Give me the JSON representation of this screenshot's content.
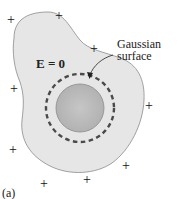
{
  "diagram": {
    "panel_label": "(a)",
    "field_label": "E = 0",
    "callout": {
      "line1": "Gaussian",
      "line2": "surface"
    },
    "charge_symbol": "+",
    "charges": [
      {
        "x": 12,
        "y": 20
      },
      {
        "x": 60,
        "y": 16
      },
      {
        "x": 95,
        "y": 49
      },
      {
        "x": 15,
        "y": 89
      },
      {
        "x": 150,
        "y": 106
      },
      {
        "x": 14,
        "y": 150
      },
      {
        "x": 127,
        "y": 166
      },
      {
        "x": 88,
        "y": 180
      },
      {
        "x": 45,
        "y": 184
      }
    ],
    "colors": {
      "conductor_fill": "#e6e6e6",
      "conductor_edge": "#8a8a8a",
      "sphere_fill": "#b9b9b9",
      "sphere_edge": "#8c8c8c",
      "dashed_line": "#4a4a4a"
    }
  }
}
